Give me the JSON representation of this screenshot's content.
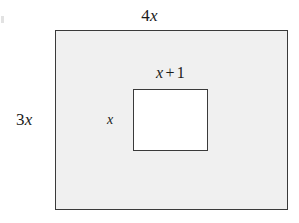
{
  "figure": {
    "background_color": "#ffffff",
    "shapes": {
      "outer_rectangle": {
        "name": "outer-rectangle",
        "fill_color": "#f0f0f0",
        "stroke_color": "#3a3a3a",
        "width_label": "4x",
        "height_label": "3x"
      },
      "inner_rectangle": {
        "name": "inner-rectangle",
        "fill_color": "#ffffff",
        "stroke_color": "#3a3a3a",
        "width_label": "x + 1",
        "height_label": "x"
      }
    },
    "labels": {
      "outer_width": {
        "coefficient": "4",
        "variable": "x",
        "full_text": "4x"
      },
      "outer_height": {
        "coefficient": "3",
        "variable": "x",
        "full_text": "3x"
      },
      "inner_width": {
        "variable": "x",
        "operator": "+",
        "constant": "1",
        "full_text": "x + 1"
      },
      "inner_height": {
        "variable": "x",
        "full_text": "x"
      }
    }
  }
}
